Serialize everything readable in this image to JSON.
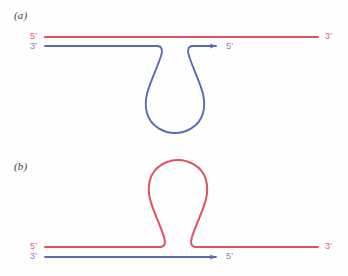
{
  "figure": {
    "type": "dna-strand-loop-diagram",
    "background_color": "#fefefe",
    "width": 348,
    "height": 276,
    "colors": {
      "red_strand": "#e0505f",
      "blue_strand": "#5d68b4",
      "red_label": "#e0636f",
      "blue_label": "#7b85c4",
      "panel_label": "#3a3a3a"
    }
  },
  "panels": [
    {
      "id": "a",
      "label": "(a)",
      "description": "Red template strand straight; blue strand forms a downward teardrop loop with 3-prime to 5-prime arrow",
      "loop_color": "blue",
      "loop_direction": "down",
      "strands": [
        {
          "name": "red-top-strand",
          "color": "#e0505f",
          "left_label": "5'",
          "right_label": "3'",
          "has_arrow": false
        },
        {
          "name": "blue-looped-strand",
          "color": "#5d68b4",
          "left_label": "3'",
          "right_label": "5'",
          "has_arrow": true
        }
      ],
      "labels": {
        "left_top": "5'",
        "left_bottom": "3'",
        "right_top": "3'",
        "arrow_end": "5'"
      }
    },
    {
      "id": "b",
      "label": "(b)",
      "description": "Red strand forms an upward teardrop loop; blue strand straight with 3-prime to 5-prime arrow",
      "loop_color": "red",
      "loop_direction": "up",
      "strands": [
        {
          "name": "red-looped-strand",
          "color": "#e0505f",
          "left_label": "5'",
          "right_label": "3'",
          "has_arrow": false
        },
        {
          "name": "blue-bottom-strand",
          "color": "#5d68b4",
          "left_label": "3'",
          "right_label": "5'",
          "has_arrow": true
        }
      ],
      "labels": {
        "left_top": "5'",
        "left_bottom": "3'",
        "right_top": "3'",
        "arrow_end": "5'"
      }
    }
  ]
}
